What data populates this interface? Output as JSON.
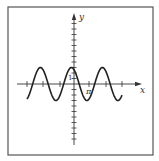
{
  "figure": {
    "frame": {
      "left": 8,
      "top": 7,
      "right": 153,
      "bottom": 155,
      "stroke": "#555555"
    },
    "axes": {
      "origin": {
        "x": 74,
        "y": 84
      },
      "x_axis": {
        "from": 17,
        "to": 142,
        "label": "x",
        "label_pos": {
          "x": 140,
          "y": 93
        }
      },
      "y_axis": {
        "from": 145,
        "to": 13,
        "label": "y",
        "label_pos": {
          "x": 79,
          "y": 20
        }
      },
      "x_ticks_px": [
        27,
        43,
        60,
        89,
        106,
        122
      ],
      "y_tick_spacing_px": 5.5,
      "y_ticks_from": 20,
      "y_ticks_to": 140,
      "color": "#333333"
    },
    "labels": {
      "one": {
        "text": "1",
        "x": 68,
        "y": 80
      },
      "pi": {
        "text": "π",
        "x": 86,
        "y": 94
      }
    },
    "curve": {
      "equation": "y = 3cos(x + π/6)",
      "x_start_px": 27,
      "x_end_px": 122,
      "px_per_pi": 15.5,
      "px_per_unit_y": 5.5,
      "amplitude": 3,
      "phase": 0.5236,
      "stroke": "#222222",
      "stroke_width": 1.6
    }
  }
}
